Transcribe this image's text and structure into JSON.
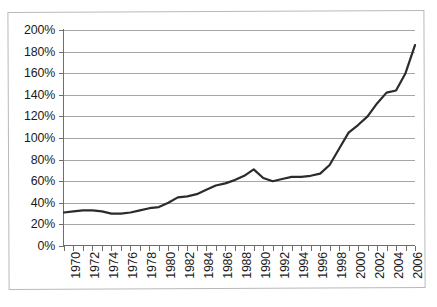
{
  "chart_data": {
    "type": "line",
    "title": "",
    "subtitle": "",
    "xlabel": "",
    "ylabel": "",
    "grid": true,
    "legend": null,
    "legend_position": "none",
    "xlim": [
      1970,
      2007
    ],
    "ylim": [
      0,
      200
    ],
    "y_tick_labels": [
      "200%",
      "180%",
      "160%",
      "140%",
      "120%",
      "100%",
      "80%",
      "60%",
      "40%",
      "20%",
      "0%"
    ],
    "y_tick_values": [
      200,
      180,
      160,
      140,
      120,
      100,
      80,
      60,
      40,
      20,
      0
    ],
    "y_tick_step": 20,
    "y_unit": "%",
    "x_tick_labels": [
      "1970",
      "1972",
      "1974",
      "1976",
      "1978",
      "1980",
      "1982",
      "1984",
      "1986",
      "1988",
      "1990",
      "1992",
      "1994",
      "1996",
      "1998",
      "2000",
      "2002",
      "2004",
      "2006"
    ],
    "x_tick_label_step": 2,
    "x_minor_tick_step": 1,
    "x_label_rotation": -90,
    "series": [
      {
        "name": "value",
        "color": "#2b2b2b",
        "line_width": 2.2,
        "x": [
          1970,
          1971,
          1972,
          1973,
          1974,
          1975,
          1976,
          1977,
          1978,
          1979,
          1980,
          1981,
          1982,
          1983,
          1984,
          1985,
          1986,
          1987,
          1988,
          1989,
          1990,
          1991,
          1992,
          1993,
          1994,
          1995,
          1996,
          1997,
          1998,
          1999,
          2000,
          2001,
          2002,
          2003,
          2004,
          2005,
          2006,
          2007
        ],
        "values": [
          31,
          32,
          33,
          33,
          32,
          30,
          30,
          31,
          33,
          35,
          36,
          40,
          45,
          46,
          48,
          52,
          56,
          58,
          61,
          65,
          71,
          63,
          60,
          62,
          64,
          64,
          65,
          67,
          75,
          90,
          105,
          112,
          120,
          132,
          142,
          144,
          160,
          186
        ]
      }
    ]
  }
}
